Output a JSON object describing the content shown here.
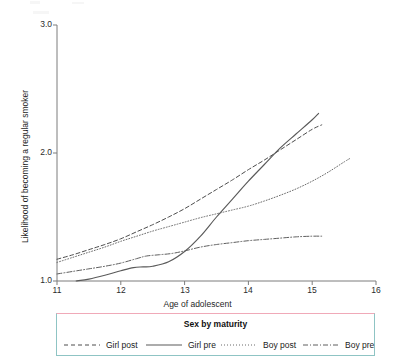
{
  "chart_data": {
    "type": "line",
    "title": "",
    "xlabel": "Age of adolescent",
    "ylabel": "Likelihood of becoming a regular smoker",
    "xlim": [
      11,
      16
    ],
    "ylim": [
      1.0,
      3.0
    ],
    "xticks": [
      11,
      12,
      13,
      14,
      15,
      16
    ],
    "xtick_labels": [
      "11",
      "12",
      "13",
      "14",
      "15",
      "16"
    ],
    "yticks": [
      1.0,
      2.0,
      3.0
    ],
    "ytick_labels": [
      "1.0",
      "2.0",
      "3.0"
    ],
    "grid": false,
    "legend_position": "below-plot",
    "legend_title": "Sex by maturity",
    "series": [
      {
        "name": "Girl post",
        "style": "dashed",
        "color": "#4d4d4d",
        "x": [
          11.0,
          11.25,
          11.5,
          11.75,
          12.0,
          12.25,
          12.5,
          12.75,
          13.0,
          13.25,
          13.5,
          13.75,
          14.0,
          14.25,
          14.5,
          14.75,
          15.0,
          15.15
        ],
        "y": [
          1.17,
          1.205,
          1.245,
          1.285,
          1.33,
          1.385,
          1.44,
          1.5,
          1.565,
          1.64,
          1.715,
          1.79,
          1.87,
          1.945,
          2.025,
          2.105,
          2.185,
          2.22
        ]
      },
      {
        "name": "Girl pre",
        "style": "solid",
        "color": "#5a5a5a",
        "x": [
          11.3,
          11.5,
          11.75,
          12.0,
          12.2,
          12.35,
          12.5,
          12.75,
          13.0,
          13.25,
          13.5,
          13.75,
          14.0,
          14.25,
          14.5,
          14.75,
          15.0,
          15.1
        ],
        "y": [
          1.0,
          1.015,
          1.045,
          1.08,
          1.105,
          1.11,
          1.115,
          1.15,
          1.23,
          1.35,
          1.5,
          1.64,
          1.78,
          1.91,
          2.04,
          2.15,
          2.26,
          2.31
        ]
      },
      {
        "name": "Boy post",
        "style": "dotted",
        "color": "#6b6b6b",
        "x": [
          11.0,
          11.25,
          11.5,
          11.75,
          12.0,
          12.25,
          12.5,
          12.75,
          13.0,
          13.25,
          13.5,
          13.75,
          14.0,
          14.25,
          14.5,
          14.75,
          15.0,
          15.25,
          15.5,
          15.6
        ],
        "y": [
          1.145,
          1.185,
          1.225,
          1.265,
          1.31,
          1.35,
          1.39,
          1.425,
          1.46,
          1.495,
          1.525,
          1.555,
          1.585,
          1.625,
          1.67,
          1.72,
          1.78,
          1.85,
          1.93,
          1.96
        ]
      },
      {
        "name": "Boy pre",
        "style": "dashdot",
        "color": "#5f5f5f",
        "x": [
          11.0,
          11.25,
          11.5,
          11.75,
          12.0,
          12.25,
          12.4,
          12.6,
          12.8,
          13.0,
          13.25,
          13.5,
          13.75,
          14.0,
          14.25,
          14.5,
          14.75,
          15.0,
          15.15
        ],
        "y": [
          1.055,
          1.075,
          1.095,
          1.115,
          1.14,
          1.175,
          1.195,
          1.205,
          1.215,
          1.235,
          1.265,
          1.285,
          1.3,
          1.315,
          1.325,
          1.335,
          1.345,
          1.35,
          1.35
        ]
      }
    ]
  },
  "axis": {
    "x_title": "Age of adolescent",
    "y_title": "Likelihood of becoming a regular smoker"
  },
  "legend": {
    "title": "Sex by maturity",
    "items": [
      {
        "label": "Girl post"
      },
      {
        "label": "Girl pre"
      },
      {
        "label": "Boy post"
      },
      {
        "label": "Boy pre"
      }
    ]
  }
}
